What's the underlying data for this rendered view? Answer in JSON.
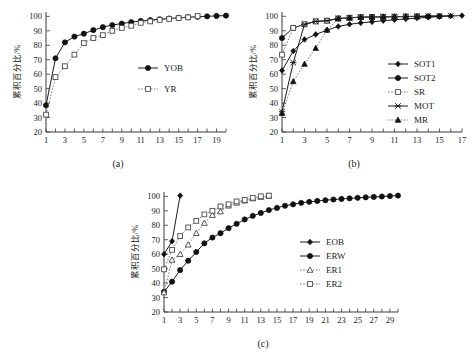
{
  "figure": {
    "y_axis_label": "累积百分比/%",
    "y_ticks": [
      20,
      30,
      40,
      50,
      60,
      70,
      80,
      90,
      100
    ],
    "y_limits": [
      20,
      103
    ]
  },
  "panels": [
    {
      "id": "a",
      "caption": "(a)",
      "x_ticks": [
        1,
        3,
        5,
        7,
        9,
        11,
        13,
        15,
        17,
        19
      ],
      "x_limits": [
        1,
        20
      ],
      "legend": [
        {
          "label": "YOB",
          "marker": "filled-circle",
          "line": "solid"
        },
        {
          "label": "YR",
          "marker": "open-square",
          "line": "dotted"
        }
      ]
    },
    {
      "id": "b",
      "caption": "(b)",
      "x_ticks": [
        1,
        3,
        5,
        7,
        9,
        11,
        13,
        15,
        17
      ],
      "x_limits": [
        1,
        17
      ],
      "legend": [
        {
          "label": "SOT1",
          "marker": "filled-diamond",
          "line": "solid"
        },
        {
          "label": "SOT2",
          "marker": "filled-circle",
          "line": "solid"
        },
        {
          "label": "SR",
          "marker": "open-square",
          "line": "dotted"
        },
        {
          "label": "MOT",
          "marker": "cross-star",
          "line": "solid"
        },
        {
          "label": "MR",
          "marker": "filled-triangle",
          "line": "dotted"
        }
      ]
    },
    {
      "id": "c",
      "caption": "(c)",
      "x_ticks": [
        1,
        3,
        5,
        7,
        9,
        11,
        13,
        15,
        17,
        19,
        21,
        23,
        25,
        27,
        29
      ],
      "x_limits": [
        1,
        30
      ],
      "legend": [
        {
          "label": "EOB",
          "marker": "filled-diamond",
          "line": "solid"
        },
        {
          "label": "ERW",
          "marker": "filled-circle",
          "line": "solid"
        },
        {
          "label": "ER1",
          "marker": "open-triangle",
          "line": "dotted"
        },
        {
          "label": "ER2",
          "marker": "open-square",
          "line": "dotted"
        }
      ]
    }
  ],
  "chart_data": [
    {
      "type": "line",
      "id": "a",
      "title": "(a)",
      "xlabel": "",
      "ylabel": "累积百分比/%",
      "xlim": [
        1,
        20
      ],
      "ylim": [
        20,
        103
      ],
      "grid": false,
      "legend_position": "right-middle",
      "x": [
        1,
        2,
        3,
        4,
        5,
        6,
        7,
        8,
        9,
        10,
        11,
        12,
        13,
        14,
        15,
        16,
        17,
        18,
        19,
        20
      ],
      "series": [
        {
          "name": "YOB",
          "marker": "filled-circle",
          "values": [
            38.5,
            71.0,
            82.0,
            86.0,
            88.0,
            90.5,
            92.5,
            94.0,
            95.0,
            96.0,
            96.8,
            97.4,
            98.0,
            98.5,
            99.0,
            99.4,
            99.7,
            100.0,
            100.3,
            100.5
          ]
        },
        {
          "name": "YR",
          "marker": "open-square",
          "values": [
            32.0,
            58.0,
            65.5,
            73.5,
            81.5,
            85.0,
            87.0,
            90.0,
            92.0,
            93.5,
            95.5,
            96.5,
            97.5,
            98.2,
            98.8,
            99.3,
            100.2,
            null,
            null,
            null
          ]
        }
      ]
    },
    {
      "type": "line",
      "id": "b",
      "title": "(b)",
      "xlabel": "",
      "ylabel": "累积百分比/%",
      "xlim": [
        1,
        17
      ],
      "ylim": [
        20,
        103
      ],
      "grid": false,
      "legend_position": "right-middle",
      "x": [
        1,
        2,
        3,
        4,
        5,
        6,
        7,
        8,
        9,
        10,
        11,
        12,
        13,
        14,
        15,
        16,
        17
      ],
      "series": [
        {
          "name": "SOT1",
          "marker": "filled-diamond",
          "values": [
            62.5,
            76.0,
            84.0,
            87.5,
            90.5,
            93.0,
            94.5,
            95.5,
            96.2,
            97.0,
            97.6,
            98.2,
            98.8,
            99.3,
            99.8,
            100.2,
            100.5
          ]
        },
        {
          "name": "SOT2",
          "marker": "filled-circle",
          "values": [
            85.0,
            92.0,
            94.5,
            96.5,
            97.0,
            98.5,
            99.0,
            99.3,
            99.5,
            99.6,
            99.7,
            99.8,
            99.9,
            100.0,
            100.1,
            null,
            null
          ]
        },
        {
          "name": "SR",
          "marker": "open-square",
          "values": [
            73.5,
            92.0,
            94.5,
            96.5,
            97.0,
            98.5,
            99.0,
            99.5,
            99.6,
            99.7,
            99.8,
            99.9,
            100.0,
            null,
            null,
            null,
            null
          ]
        },
        {
          "name": "MOT",
          "marker": "cross-star",
          "values": [
            34.0,
            68.0,
            94.5,
            96.5,
            97.0,
            98.5,
            99.0,
            99.5,
            99.6,
            99.7,
            99.8,
            99.9,
            100.0,
            100.2,
            100.3,
            100.4,
            null
          ]
        },
        {
          "name": "MR",
          "marker": "filled-triangle",
          "values": [
            33.0,
            55.0,
            67.0,
            78.0,
            90.5,
            98.5,
            99.0,
            99.4,
            99.6,
            99.7,
            99.8,
            99.9,
            100.0,
            null,
            null,
            null,
            null
          ]
        }
      ]
    },
    {
      "type": "line",
      "id": "c",
      "title": "(c)",
      "xlabel": "",
      "ylabel": "累积百分比/%",
      "xlim": [
        1,
        30
      ],
      "ylim": [
        20,
        103
      ],
      "grid": false,
      "legend_position": "right-middle",
      "x": [
        1,
        2,
        3,
        4,
        5,
        6,
        7,
        8,
        9,
        10,
        11,
        12,
        13,
        14,
        15,
        16,
        17,
        18,
        19,
        20,
        21,
        22,
        23,
        24,
        25,
        26,
        27,
        28,
        29,
        30
      ],
      "series": [
        {
          "name": "EOB",
          "marker": "filled-diamond",
          "values": [
            60.0,
            69.0,
            100.5,
            null,
            null,
            null,
            null,
            null,
            null,
            null,
            null,
            null,
            null,
            null,
            null,
            null,
            null,
            null,
            null,
            null,
            null,
            null,
            null,
            null,
            null,
            null,
            null,
            null,
            null,
            null
          ]
        },
        {
          "name": "ERW",
          "marker": "filled-circle",
          "values": [
            34.0,
            41.0,
            49.0,
            55.5,
            61.5,
            67.5,
            71.5,
            74.5,
            78.0,
            81.0,
            84.0,
            86.5,
            88.5,
            90.5,
            92.0,
            93.5,
            94.5,
            95.5,
            96.2,
            96.8,
            97.3,
            97.8,
            98.2,
            98.6,
            99.0,
            99.3,
            99.6,
            99.9,
            100.2,
            100.5
          ]
        },
        {
          "name": "ER1",
          "marker": "open-triangle",
          "values": [
            33.5,
            56.0,
            60.0,
            66.5,
            74.5,
            81.5,
            87.0,
            89.5,
            93.5,
            95.5,
            97.0,
            98.5,
            99.5,
            100.3,
            null,
            null,
            null,
            null,
            null,
            null,
            null,
            null,
            null,
            null,
            null,
            null,
            null,
            null,
            null,
            null
          ]
        },
        {
          "name": "ER2",
          "marker": "open-square",
          "values": [
            49.5,
            63.0,
            72.5,
            78.5,
            83.0,
            87.5,
            90.0,
            93.0,
            94.5,
            96.5,
            97.5,
            99.0,
            100.0,
            100.5,
            null,
            null,
            null,
            null,
            null,
            null,
            null,
            null,
            null,
            null,
            null,
            null,
            null,
            null,
            null,
            null
          ]
        }
      ]
    }
  ]
}
